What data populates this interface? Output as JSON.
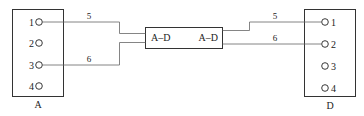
{
  "left_connector": {
    "label": "A",
    "pins": [
      "1",
      "2",
      "3",
      "4"
    ]
  },
  "right_connector": {
    "label": "D",
    "pins": [
      "1",
      "2",
      "3",
      "4"
    ]
  },
  "adapter": {
    "left_label": "A–D",
    "right_label": "A–D"
  },
  "wires": [
    {
      "id": "5",
      "from": "A-1",
      "to": "D-1",
      "left_label": "5",
      "right_label": "5"
    },
    {
      "id": "6",
      "from": "A-3",
      "to": "D-2",
      "left_label": "6",
      "right_label": "6"
    }
  ]
}
